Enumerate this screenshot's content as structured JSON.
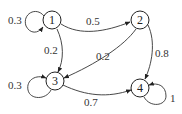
{
  "diagram": {
    "type": "markov-chain",
    "nodes": [
      {
        "id": "1",
        "label": "1",
        "x": 52,
        "y": 20
      },
      {
        "id": "2",
        "label": "2",
        "x": 140,
        "y": 20
      },
      {
        "id": "3",
        "label": "3",
        "x": 55,
        "y": 81
      },
      {
        "id": "4",
        "label": "4",
        "x": 140,
        "y": 88
      }
    ],
    "edges": [
      {
        "from": "1",
        "to": "1",
        "label": "0.3"
      },
      {
        "from": "1",
        "to": "2",
        "label": "0.5"
      },
      {
        "from": "1",
        "to": "3",
        "label": "0.2"
      },
      {
        "from": "2",
        "to": "3",
        "label": "0.2"
      },
      {
        "from": "2",
        "to": "4",
        "label": "0.8"
      },
      {
        "from": "3",
        "to": "3",
        "label": "0.3"
      },
      {
        "from": "3",
        "to": "4",
        "label": "0.7"
      },
      {
        "from": "4",
        "to": "4",
        "label": "1"
      }
    ]
  }
}
